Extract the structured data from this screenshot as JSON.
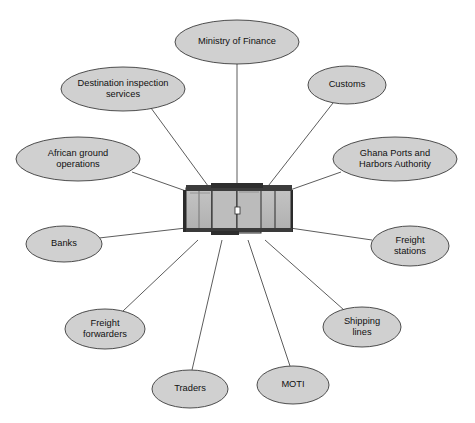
{
  "diagram": {
    "type": "hub-and-spoke",
    "title": "",
    "colors": {
      "node_fill": "#d0d0d0",
      "node_stroke": "#3b3b3b",
      "line_stroke": "#4a4a4a",
      "text": "#111111",
      "background": "#ffffff",
      "hub_body_fill": "#b5b5b5",
      "hub_body_fill_light": "#c2c2c2",
      "hub_roof_fill": "#3c3c3c",
      "hub_outline": "#2b2b2b"
    },
    "hub": {
      "name": "port-terminal-building",
      "label": "",
      "x": 237,
      "y": 211,
      "width": 104,
      "height": 52
    },
    "nodes": [
      {
        "id": "ministry-of-finance",
        "label": "Ministry of Finance",
        "lines": [
          "Ministry of Finance"
        ],
        "cx": 237,
        "cy": 42,
        "rx": 62,
        "ry": 22,
        "anchor_x": 237,
        "anchor_y": 64,
        "hub_x": 237,
        "hub_y": 190
      },
      {
        "id": "destination-inspection-services",
        "label": "Destination inspection services",
        "lines": [
          "Destination inspection",
          "services"
        ],
        "cx": 123,
        "cy": 89,
        "rx": 62,
        "ry": 22,
        "anchor_x": 151,
        "anchor_y": 108,
        "hub_x": 211,
        "hub_y": 190
      },
      {
        "id": "african-ground-operations",
        "label": "African ground operations",
        "lines": [
          "African ground",
          "operations"
        ],
        "cx": 78,
        "cy": 159,
        "rx": 62,
        "ry": 22,
        "anchor_x": 132,
        "anchor_y": 172,
        "hub_x": 186,
        "hub_y": 191
      },
      {
        "id": "banks",
        "label": "Banks",
        "lines": [
          "Banks"
        ],
        "cx": 64,
        "cy": 244,
        "rx": 38,
        "ry": 18,
        "anchor_x": 99,
        "anchor_y": 238,
        "hub_x": 186,
        "hub_y": 228
      },
      {
        "id": "freight-forwarders",
        "label": "Freight forwarders",
        "lines": [
          "Freight",
          "forwarders"
        ],
        "cx": 105,
        "cy": 329,
        "rx": 40,
        "ry": 20,
        "anchor_x": 123,
        "anchor_y": 311,
        "hub_x": 198,
        "hub_y": 240
      },
      {
        "id": "traders",
        "label": "Traders",
        "lines": [
          "Traders"
        ],
        "cx": 190,
        "cy": 389,
        "rx": 38,
        "ry": 19,
        "anchor_x": 192,
        "anchor_y": 370,
        "hub_x": 222,
        "hub_y": 240
      },
      {
        "id": "moti",
        "label": "MOTI",
        "lines": [
          "MOTI"
        ],
        "cx": 293,
        "cy": 385,
        "rx": 36,
        "ry": 19,
        "anchor_x": 290,
        "anchor_y": 366,
        "hub_x": 248,
        "hub_y": 240
      },
      {
        "id": "shipping-lines",
        "label": "Shipping lines",
        "lines": [
          "Shipping",
          "lines"
        ],
        "cx": 362,
        "cy": 327,
        "rx": 39,
        "ry": 20,
        "anchor_x": 344,
        "anchor_y": 310,
        "hub_x": 265,
        "hub_y": 240
      },
      {
        "id": "freight-stations",
        "label": "Freight stations",
        "lines": [
          "Freight",
          "stations"
        ],
        "cx": 410,
        "cy": 246,
        "rx": 39,
        "ry": 20,
        "anchor_x": 372,
        "anchor_y": 240,
        "hub_x": 290,
        "hub_y": 228
      },
      {
        "id": "ghana-ports-and-harbors-authority",
        "label": "Ghana Ports and Harbors Authority",
        "lines": [
          "Ghana Ports and",
          "Harbors Authority"
        ],
        "cx": 395,
        "cy": 159,
        "rx": 62,
        "ry": 22,
        "anchor_x": 341,
        "anchor_y": 172,
        "hub_x": 290,
        "hub_y": 190
      },
      {
        "id": "customs",
        "label": "Customs",
        "lines": [
          "Customs"
        ],
        "cx": 347,
        "cy": 85,
        "rx": 39,
        "ry": 19,
        "anchor_x": 333,
        "anchor_y": 103,
        "hub_x": 265,
        "hub_y": 190
      }
    ]
  }
}
